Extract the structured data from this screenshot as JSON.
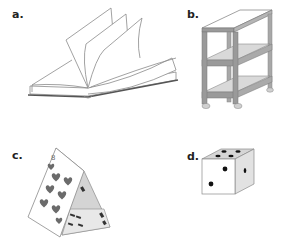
{
  "figure": {
    "panels": [
      {
        "id": "a",
        "label": "a.",
        "subject": "open-book"
      },
      {
        "id": "b",
        "label": "b.",
        "subject": "shelf-cart"
      },
      {
        "id": "c",
        "label": "c.",
        "subject": "house-of-cards",
        "card_rank": "8",
        "card_suit": "hearts"
      },
      {
        "id": "d",
        "label": "d.",
        "subject": "die",
        "top_face_pips": 4,
        "front_face_pips": 2,
        "side_face_pips": 1
      }
    ]
  },
  "colors": {
    "background": "#ffffff",
    "line": "#8a8a8a",
    "dark": "#222222",
    "shelf_frame": "#9a9a9a",
    "shelf_board": "#d9d9d9",
    "card_pip": "#6b6b6b",
    "shade": "#cfcfcf"
  }
}
